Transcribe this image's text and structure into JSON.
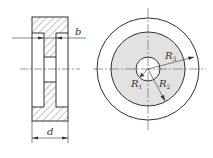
{
  "diagram": {
    "type": "engineering-drawing",
    "views": {
      "section": {
        "labels": {
          "thickness_gap": "b",
          "width": "d"
        }
      },
      "front": {
        "labels": {
          "r1": {
            "main": "R",
            "sub": "1"
          },
          "r2": {
            "main": "R",
            "sub": "2"
          },
          "r3": {
            "main": "R",
            "sub": "3"
          }
        }
      }
    },
    "colors": {
      "line": "#333333",
      "shade": "#e2e2e2",
      "background": "#ffffff"
    }
  }
}
